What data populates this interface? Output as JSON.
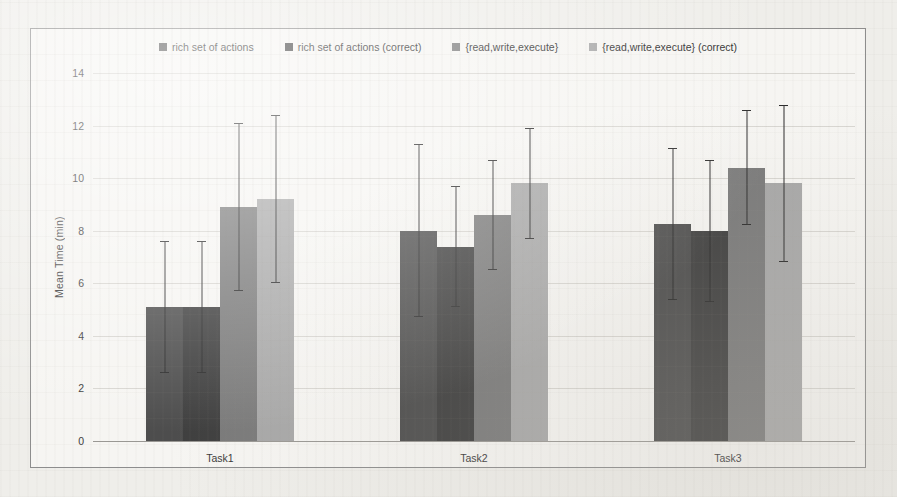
{
  "chart_data": {
    "type": "bar",
    "title": "",
    "xlabel": "",
    "ylabel": "Mean Time (min)",
    "ylim": [
      0,
      14
    ],
    "ytick_step": 2,
    "yticks": [
      "14",
      "12",
      "10",
      "8",
      "6",
      "4",
      "2",
      "0"
    ],
    "grid": true,
    "legend_position": "top",
    "categories": [
      "Task1",
      "Task2",
      "Task3"
    ],
    "series": [
      {
        "name": "rich set of actions",
        "color": "#4d4d4d",
        "values": [
          5.1,
          8.0,
          8.25
        ],
        "errors": [
          2.5,
          3.3,
          2.9
        ]
      },
      {
        "name": "rich set of actions (correct)",
        "color": "#3f3f3f",
        "values": [
          5.1,
          7.4,
          8.0
        ],
        "errors": [
          2.5,
          2.3,
          2.7
        ]
      },
      {
        "name": "{read,write,execute}",
        "color": "#7a7a7a",
        "values": [
          8.9,
          8.6,
          10.4
        ],
        "errors": [
          3.2,
          2.1,
          2.2
        ]
      },
      {
        "name": "{read,write,execute} (correct)",
        "color": "#a8a8a8",
        "values": [
          9.2,
          9.8,
          9.8
        ],
        "errors": [
          3.2,
          2.1,
          3.0
        ]
      }
    ]
  },
  "colors": {
    "page_background": "#efeeea",
    "plot_background": "#f6f5f2",
    "frame_border": "#8d8d8d",
    "gridline": "#d8d6d1",
    "axis": "#9a9894",
    "error_bar": "#2b2b2b",
    "text": "#3a3a3a"
  }
}
